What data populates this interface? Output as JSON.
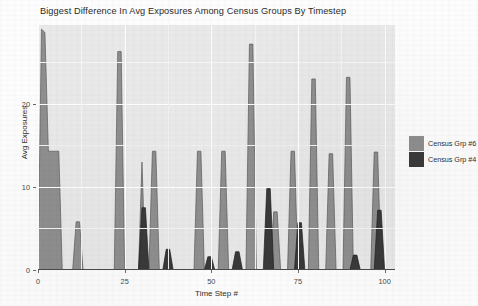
{
  "chart_data": {
    "type": "area",
    "title": "Biggest Difference In Avg Exposures Among Census Groups By Timestep",
    "xlabel": "Time Step #",
    "ylabel": "Avg Exposures",
    "xlim": [
      0,
      103
    ],
    "ylim": [
      0,
      29.5
    ],
    "xticks": [
      0,
      25,
      50,
      75,
      100
    ],
    "xtick_labels": [
      "0",
      "25",
      "50",
      "75",
      "100"
    ],
    "yticks": [
      0,
      10,
      20
    ],
    "ytick_labels": [
      "0",
      "10",
      "20"
    ],
    "grid": true,
    "legend_position": "right",
    "panel_background": "#e9e9e9",
    "grid_color": "#ffffff",
    "series": [
      {
        "name": "Census Grp #6",
        "color": "#8f8f8f",
        "edge_color": "#5a5a5a",
        "x": [
          0,
          1,
          2,
          3,
          4,
          5,
          6,
          7,
          8,
          9,
          10,
          11,
          12,
          13,
          14,
          15,
          16,
          17,
          18,
          19,
          20,
          21,
          22,
          23,
          24,
          25,
          26,
          27,
          28,
          29,
          30,
          31,
          32,
          33,
          34,
          35,
          36,
          37,
          38,
          39,
          40,
          41,
          42,
          43,
          44,
          45,
          46,
          47,
          48,
          49,
          50,
          51,
          52,
          53,
          54,
          55,
          56,
          57,
          58,
          59,
          60,
          61,
          62,
          63,
          64,
          65,
          66,
          67,
          68,
          69,
          70,
          71,
          72,
          73,
          74,
          75,
          76,
          77,
          78,
          79,
          80,
          81,
          82,
          83,
          84,
          85,
          86,
          87,
          88,
          89,
          90,
          91,
          92,
          93,
          94,
          95,
          96,
          97,
          98,
          99,
          100
        ],
        "values": [
          0,
          29.0,
          28.6,
          14.3,
          14.3,
          14.3,
          14.3,
          0,
          0,
          0,
          0,
          5.8,
          5.8,
          0,
          0,
          0,
          0,
          0,
          0,
          0,
          0,
          0,
          0,
          26.3,
          26.3,
          0,
          0,
          0,
          0,
          0,
          13.0,
          0,
          0,
          14.3,
          14.3,
          0,
          0,
          0,
          0,
          0,
          0,
          0,
          0,
          0,
          0,
          0,
          14.3,
          14.3,
          0,
          0,
          0,
          0,
          0,
          14.3,
          14.3,
          0,
          0,
          0,
          0,
          0,
          0,
          27.2,
          27.2,
          0,
          0,
          0,
          0,
          0,
          7.0,
          7.0,
          0,
          0,
          0,
          14.3,
          14.3,
          0,
          0,
          0,
          0,
          23.0,
          23.0,
          0,
          0,
          0,
          14.0,
          14.0,
          0,
          0,
          0,
          23.2,
          23.2,
          0,
          0,
          0,
          0,
          0,
          0,
          14.2,
          14.2,
          0,
          0
        ]
      },
      {
        "name": "Census Grp #4",
        "color": "#3a3a3a",
        "edge_color": "#1f1f1f",
        "x": [
          0,
          1,
          2,
          3,
          4,
          5,
          6,
          7,
          8,
          9,
          10,
          11,
          12,
          13,
          14,
          15,
          16,
          17,
          18,
          19,
          20,
          21,
          22,
          23,
          24,
          25,
          26,
          27,
          28,
          29,
          30,
          31,
          32,
          33,
          34,
          35,
          36,
          37,
          38,
          39,
          40,
          41,
          42,
          43,
          44,
          45,
          46,
          47,
          48,
          49,
          50,
          51,
          52,
          53,
          54,
          55,
          56,
          57,
          58,
          59,
          60,
          61,
          62,
          63,
          64,
          65,
          66,
          67,
          68,
          69,
          70,
          71,
          72,
          73,
          74,
          75,
          76,
          77,
          78,
          79,
          80,
          81,
          82,
          83,
          84,
          85,
          86,
          87,
          88,
          89,
          90,
          91,
          92,
          93,
          94,
          95,
          96,
          97,
          98,
          99,
          100
        ],
        "values": [
          0,
          0,
          0,
          0,
          0,
          0,
          0,
          0,
          0,
          0,
          0,
          0,
          0,
          0,
          0,
          0,
          0,
          0,
          0,
          0,
          0,
          0,
          0,
          0,
          0,
          0,
          0,
          0,
          0,
          0,
          7.5,
          7.5,
          0,
          0,
          0,
          0,
          0,
          2.5,
          2.5,
          0,
          0,
          0,
          0,
          0,
          0,
          0,
          0,
          0,
          0,
          1.6,
          1.6,
          0,
          0,
          0,
          0,
          0,
          0,
          2.2,
          2.2,
          0,
          0,
          0,
          0,
          0,
          0,
          0,
          9.8,
          9.8,
          0,
          0,
          0,
          0,
          0,
          0,
          0,
          5.7,
          5.7,
          0,
          0,
          0,
          0,
          0,
          0,
          0,
          0,
          0,
          0,
          0,
          0,
          0,
          0,
          1.8,
          1.8,
          0,
          0,
          0,
          0,
          0,
          7.2,
          7.2,
          0
        ]
      }
    ]
  },
  "legend": {
    "items": [
      {
        "label": "Census Grp #6",
        "color": "#8f8f8f"
      },
      {
        "label": "Census Grp #4",
        "color": "#3a3a3a"
      }
    ]
  }
}
